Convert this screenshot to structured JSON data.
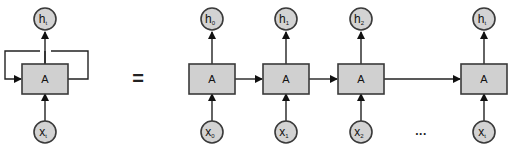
{
  "diagram": {
    "type": "rnn-unrolled",
    "colors": {
      "node_fill": "#d3d3d3",
      "box_fill": "#d0d0d0",
      "stroke": "#3a3a3a"
    },
    "rolled": {
      "cell_label": "A",
      "output": {
        "base": "h",
        "sub": "t"
      },
      "input": {
        "base": "x",
        "sub": "t"
      }
    },
    "equals_sign": "=",
    "unrolled": [
      {
        "cell_label": "A",
        "output": {
          "base": "h",
          "sub": "0"
        },
        "input": {
          "base": "x",
          "sub": "0"
        }
      },
      {
        "cell_label": "A",
        "output": {
          "base": "h",
          "sub": "1"
        },
        "input": {
          "base": "x",
          "sub": "1"
        }
      },
      {
        "cell_label": "A",
        "output": {
          "base": "h",
          "sub": "2"
        },
        "input": {
          "base": "x",
          "sub": "2"
        }
      },
      {
        "cell_label": "A",
        "output": {
          "base": "h",
          "sub": "t"
        },
        "input": {
          "base": "x",
          "sub": "t"
        }
      }
    ],
    "ellipsis": "..."
  }
}
